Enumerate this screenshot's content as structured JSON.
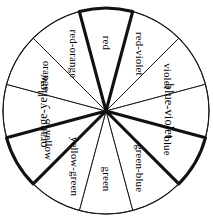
{
  "figure": {
    "type": "twelve-part color wheel diagram",
    "background_color": "#ffffff",
    "line_color": "#1a1a1a",
    "wedge_fill": "#ffffff",
    "center_x": 106,
    "center_y": 111,
    "radius": 103,
    "segment_count": 12,
    "segment_span_degrees": 30
  },
  "segments": [
    {
      "id": "red",
      "label": "red",
      "emphasis": "bold",
      "start_angle": -15,
      "end_angle": 15,
      "label_rotation": 90,
      "label_radius": 68,
      "font_class": "wedge-label"
    },
    {
      "id": "red-violet",
      "label": "red-violet",
      "emphasis": "thin",
      "start_angle": 15,
      "end_angle": 45,
      "label_rotation": 60,
      "label_radius": 66,
      "font_class": "wedge-label"
    },
    {
      "id": "violet",
      "label": "violet",
      "emphasis": "thin",
      "start_angle": 45,
      "end_angle": 75,
      "label_rotation": 30,
      "label_radius": 70,
      "font_class": "wedge-label"
    },
    {
      "id": "blue-violet",
      "label": "blue-violet",
      "emphasis": "thin",
      "start_angle": 75,
      "end_angle": 105,
      "label_rotation": 0,
      "label_radius": 62,
      "font_class": "wedge-label wide"
    },
    {
      "id": "blue",
      "label": "blue",
      "emphasis": "bold",
      "start_angle": 105,
      "end_angle": 135,
      "label_rotation": -30,
      "label_radius": 70,
      "font_class": "wedge-label"
    },
    {
      "id": "green-blue",
      "label": "green-blue",
      "emphasis": "thin",
      "start_angle": 135,
      "end_angle": 165,
      "label_rotation": -60,
      "label_radius": 66,
      "font_class": "wedge-label"
    },
    {
      "id": "green",
      "label": "green",
      "emphasis": "thin",
      "start_angle": 165,
      "end_angle": 195,
      "label_rotation": -90,
      "label_radius": 68,
      "font_class": "wedge-label"
    },
    {
      "id": "yellow-green",
      "label": "yellow-green",
      "emphasis": "thin",
      "start_angle": 195,
      "end_angle": 225,
      "label_rotation": -120,
      "label_radius": 64,
      "font_class": "wedge-label"
    },
    {
      "id": "yellow",
      "label": "yellow",
      "emphasis": "bold",
      "start_angle": 225,
      "end_angle": 255,
      "label_rotation": -150,
      "label_radius": 68,
      "font_class": "wedge-label"
    },
    {
      "id": "orange-yellow",
      "label": "orange-yellow",
      "emphasis": "thin",
      "start_angle": 255,
      "end_angle": 285,
      "label_rotation": 0,
      "label_radius": 62,
      "font_class": "wedge-label wide"
    },
    {
      "id": "orange",
      "label": "orange",
      "emphasis": "thin",
      "start_angle": 285,
      "end_angle": 315,
      "label_rotation": 150,
      "label_radius": 70,
      "font_class": "wedge-label"
    },
    {
      "id": "red-orange",
      "label": "red-orange",
      "emphasis": "thin",
      "start_angle": 315,
      "end_angle": 345,
      "label_rotation": 120,
      "label_radius": 66,
      "font_class": "wedge-label"
    }
  ]
}
